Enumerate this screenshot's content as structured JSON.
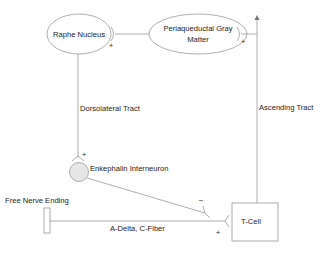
{
  "diagram": {
    "type": "neural pain-modulation pathway",
    "colors": {
      "line": "#9a9a9a",
      "node_fill": "#ffffff",
      "interneuron_fill": "#e6e6e6",
      "text": "#222222"
    },
    "nodes": {
      "raphe": {
        "label": "Raphe Nucleus",
        "shape": "ellipse"
      },
      "pag": {
        "label_line1": "Periaqueductal Gray",
        "label_line2": "Matter",
        "shape": "ellipse"
      },
      "enkephalin": {
        "label": "Enkephalin Interneuron",
        "shape": "circle"
      },
      "tcell": {
        "label": "T-Cell",
        "shape": "rectangle"
      },
      "free_nerve": {
        "label": "Free Nerve Ending",
        "shape": "rectangle"
      }
    },
    "edges": {
      "dorsolateral": {
        "label": "Dorsolateral Tract"
      },
      "ascending": {
        "label": "Ascending Tract"
      },
      "fiber": {
        "label": "A-Delta, C-Fiber"
      }
    },
    "signs": {
      "raphe_to_pag": "+",
      "pag_to_ascending": "+",
      "dorsolateral_to_enkephalin": "+",
      "enkephalin_to_tcell": "−",
      "fiber_to_tcell": "+",
      "ascending_top": "+"
    }
  }
}
